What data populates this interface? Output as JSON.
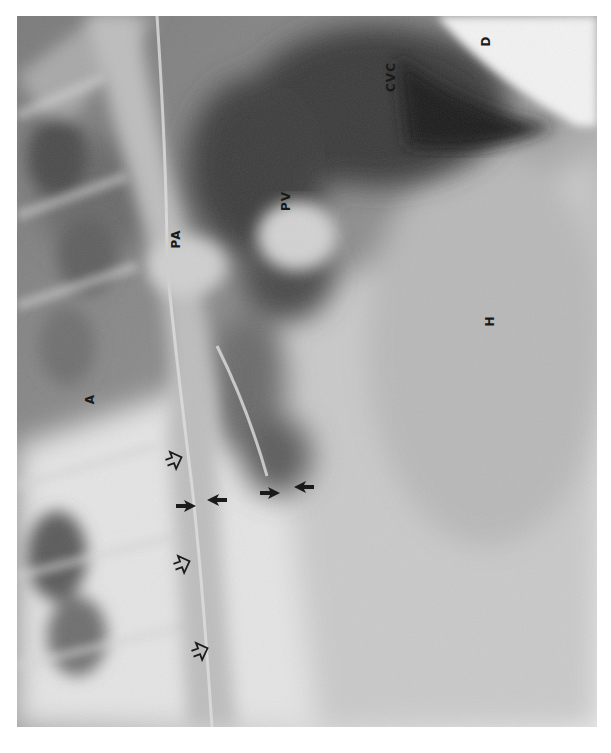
{
  "image": {
    "description": "Lateral thoracic radiograph (rotated 90 degrees) with anatomical labels and arrows",
    "orientation": "rotated 90deg counterclockwise"
  },
  "labels": [
    {
      "id": "D",
      "text": "D",
      "meaning": "diaphragm",
      "x": 487,
      "y": 43
    },
    {
      "id": "CVC",
      "text": "CVC",
      "meaning": "caudal vena cava",
      "x": 388,
      "y": 78
    },
    {
      "id": "PV",
      "text": "PV",
      "meaning": "pulmonary vein",
      "x": 284,
      "y": 202
    },
    {
      "id": "PA",
      "text": "PA",
      "meaning": "pulmonary artery",
      "x": 175,
      "y": 240
    },
    {
      "id": "H",
      "text": "H",
      "meaning": "heart",
      "x": 489,
      "y": 322
    },
    {
      "id": "A",
      "text": "A",
      "meaning": "aorta",
      "x": 91,
      "y": 400
    }
  ],
  "arrows": {
    "solid": [
      {
        "x": 181,
        "y": 506
      },
      {
        "x": 218,
        "y": 500
      },
      {
        "x": 268,
        "y": 493
      },
      {
        "x": 303,
        "y": 487
      }
    ],
    "open": [
      {
        "x": 175,
        "y": 460
      },
      {
        "x": 182,
        "y": 563
      },
      {
        "x": 200,
        "y": 651
      }
    ]
  },
  "colors": {
    "background": "#ffffff",
    "label": "#1a1a1a",
    "film_dark": "#2a2a2a",
    "film_mid": "#8c8c8c",
    "film_light": "#e6e6e6"
  }
}
